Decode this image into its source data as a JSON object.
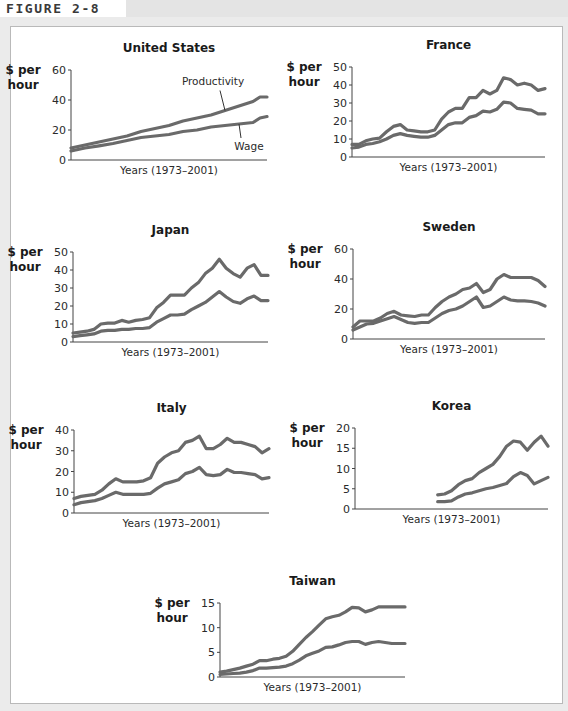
{
  "figure": {
    "label": "FIGURE 2-8"
  },
  "colors": {
    "line": "#6a6a6a",
    "axis": "#444444",
    "frame_bg": "#ffffff",
    "page_bg": "#ebebeb"
  },
  "chart_data": [
    {
      "type": "line",
      "title": "United States",
      "ylabel": [
        "$ per",
        "hour"
      ],
      "xlabel": "Years (1973–2001)",
      "ylim": [
        0,
        60
      ],
      "yticks": [
        0,
        20,
        40,
        60
      ],
      "x_range": [
        1973,
        2001
      ],
      "grid": false,
      "annotations": [
        {
          "text": "Productivity",
          "series": "Productivity"
        },
        {
          "text": "Wage",
          "series": "Wage"
        }
      ],
      "layout": {
        "ax_x": 71,
        "ax_y0": 160,
        "ax_ytop": 70,
        "ax_xend": 267
      },
      "series": [
        {
          "name": "Productivity",
          "x": [
            1973,
            1975,
            1977,
            1979,
            1981,
            1983,
            1985,
            1987,
            1989,
            1991,
            1993,
            1995,
            1997,
            1999,
            2000,
            2001
          ],
          "values": [
            8,
            10,
            12,
            14,
            16,
            19,
            21,
            23,
            26,
            28,
            30,
            33,
            36,
            39,
            42,
            42
          ]
        },
        {
          "name": "Wage",
          "x": [
            1973,
            1975,
            1977,
            1979,
            1981,
            1983,
            1985,
            1987,
            1989,
            1991,
            1993,
            1995,
            1997,
            1999,
            2000,
            2001
          ],
          "values": [
            6,
            8,
            9.5,
            11,
            13,
            15,
            16,
            17,
            19,
            20,
            22,
            23,
            24,
            25,
            28,
            29
          ]
        }
      ]
    },
    {
      "type": "line",
      "title": "France",
      "ylabel": [
        "$ per",
        "hour"
      ],
      "xlabel": "Years (1973–2001)",
      "ylim": [
        0,
        50
      ],
      "yticks": [
        0,
        10,
        20,
        30,
        40,
        50
      ],
      "x_range": [
        1973,
        2001
      ],
      "grid": false,
      "layout": {
        "ax_x": 352,
        "ax_y0": 157,
        "ax_ytop": 67,
        "ax_xend": 545
      },
      "series": [
        {
          "name": "Productivity",
          "x": [
            1973,
            1974,
            1975,
            1976,
            1977,
            1978,
            1979,
            1980,
            1981,
            1982,
            1983,
            1984,
            1985,
            1986,
            1987,
            1988,
            1989,
            1990,
            1991,
            1992,
            1993,
            1994,
            1995,
            1996,
            1997,
            1998,
            1999,
            2000,
            2001
          ],
          "values": [
            7,
            7,
            9,
            10,
            10.5,
            14,
            17,
            18,
            15,
            14.5,
            14,
            14,
            15,
            21,
            25,
            27,
            27,
            33,
            33,
            37,
            35,
            37,
            44,
            43,
            40,
            41,
            40,
            37,
            38
          ]
        },
        {
          "name": "Wage",
          "x": [
            1973,
            1974,
            1975,
            1976,
            1977,
            1978,
            1979,
            1980,
            1981,
            1982,
            1983,
            1984,
            1985,
            1986,
            1987,
            1988,
            1989,
            1990,
            1991,
            1992,
            1993,
            1994,
            1995,
            1996,
            1997,
            1998,
            1999,
            2000,
            2001
          ],
          "values": [
            5,
            5.5,
            7,
            7.5,
            8.5,
            10,
            12,
            13,
            12,
            11.5,
            11,
            11,
            12,
            15,
            18,
            19,
            19,
            22,
            23,
            25.5,
            25,
            26.5,
            30.5,
            30,
            27,
            26.5,
            26,
            24,
            24
          ]
        }
      ]
    },
    {
      "type": "line",
      "title": "Japan",
      "ylabel": [
        "$ per",
        "hour"
      ],
      "xlabel": "Years (1973–2001)",
      "ylim": [
        0,
        50
      ],
      "yticks": [
        0,
        10,
        20,
        30,
        40,
        50
      ],
      "x_range": [
        1973,
        2001
      ],
      "grid": false,
      "layout": {
        "ax_x": 73,
        "ax_y0": 342,
        "ax_ytop": 252,
        "ax_xend": 268
      },
      "series": [
        {
          "name": "Productivity",
          "x": [
            1973,
            1974,
            1975,
            1976,
            1977,
            1978,
            1979,
            1980,
            1981,
            1982,
            1983,
            1984,
            1985,
            1986,
            1987,
            1988,
            1989,
            1990,
            1991,
            1992,
            1993,
            1994,
            1995,
            1996,
            1997,
            1998,
            1999,
            2000,
            2001
          ],
          "values": [
            5,
            5.5,
            6,
            7,
            10,
            10.5,
            10.5,
            12,
            11,
            12,
            12.5,
            13.5,
            19,
            22,
            26,
            26,
            26,
            30,
            33,
            38,
            41,
            46,
            41,
            38,
            36,
            41,
            43,
            37,
            37
          ]
        },
        {
          "name": "Wage",
          "x": [
            1973,
            1974,
            1975,
            1976,
            1977,
            1978,
            1979,
            1980,
            1981,
            1982,
            1983,
            1984,
            1985,
            1986,
            1987,
            1988,
            1989,
            1990,
            1991,
            1992,
            1993,
            1994,
            1995,
            1996,
            1997,
            1998,
            1999,
            2000,
            2001
          ],
          "values": [
            3,
            3.5,
            4,
            4.5,
            6,
            6.5,
            6.5,
            7,
            7,
            7.5,
            7.5,
            8,
            11,
            13,
            15,
            15,
            15.5,
            18,
            20,
            22,
            25,
            28,
            25,
            22.5,
            21.5,
            24,
            25.5,
            23,
            23
          ]
        }
      ]
    },
    {
      "type": "line",
      "title": "Sweden",
      "ylabel": [
        "$ per",
        "hour"
      ],
      "xlabel": "Years (1973–2001)",
      "ylim": [
        0,
        60
      ],
      "yticks": [
        0,
        20,
        40,
        60
      ],
      "x_range": [
        1973,
        2001
      ],
      "grid": false,
      "layout": {
        "ax_x": 353,
        "ax_y0": 339,
        "ax_ytop": 249,
        "ax_xend": 545
      },
      "series": [
        {
          "name": "Productivity",
          "x": [
            1973,
            1974,
            1975,
            1976,
            1977,
            1978,
            1979,
            1980,
            1981,
            1982,
            1983,
            1984,
            1985,
            1986,
            1987,
            1988,
            1989,
            1990,
            1991,
            1992,
            1993,
            1994,
            1995,
            1996,
            1997,
            1998,
            1999,
            2000,
            2001
          ],
          "values": [
            8,
            12,
            12,
            12,
            14,
            17,
            18.5,
            16,
            15.5,
            15,
            16,
            16,
            21,
            25,
            28,
            30,
            33,
            34,
            37,
            31,
            33,
            40,
            43,
            41,
            41,
            41,
            41,
            39,
            35
          ]
        },
        {
          "name": "Wage",
          "x": [
            1973,
            1974,
            1975,
            1976,
            1977,
            1978,
            1979,
            1980,
            1981,
            1982,
            1983,
            1984,
            1985,
            1986,
            1987,
            1988,
            1989,
            1990,
            1991,
            1992,
            1993,
            1994,
            1995,
            1996,
            1997,
            1998,
            1999,
            2000,
            2001
          ],
          "values": [
            6,
            8,
            10,
            10.5,
            12,
            13.5,
            15,
            13,
            11,
            10.5,
            11,
            11,
            14,
            17,
            19,
            20,
            22,
            25,
            28,
            21,
            22,
            25,
            28,
            26,
            25.5,
            25.5,
            25,
            24,
            22
          ]
        }
      ]
    },
    {
      "type": "line",
      "title": "Italy",
      "ylabel": [
        "$ per",
        "hour"
      ],
      "xlabel": "Years (1973–2001)",
      "ylim": [
        0,
        40
      ],
      "yticks": [
        0,
        10,
        20,
        30,
        40
      ],
      "x_range": [
        1973,
        2001
      ],
      "grid": false,
      "layout": {
        "ax_x": 74,
        "ax_y0": 513,
        "ax_ytop": 430,
        "ax_xend": 269
      },
      "series": [
        {
          "name": "Productivity",
          "x": [
            1973,
            1974,
            1975,
            1976,
            1977,
            1978,
            1979,
            1980,
            1981,
            1982,
            1983,
            1984,
            1985,
            1986,
            1987,
            1988,
            1989,
            1990,
            1991,
            1992,
            1993,
            1994,
            1995,
            1996,
            1997,
            1998,
            1999,
            2000,
            2001
          ],
          "values": [
            7,
            8,
            8.5,
            9,
            11,
            14,
            16.5,
            15,
            15,
            15,
            15.5,
            17,
            24,
            27,
            29,
            30,
            34,
            35,
            37,
            31,
            31,
            33,
            36,
            34,
            34,
            33,
            32,
            29,
            31
          ]
        },
        {
          "name": "Wage",
          "x": [
            1973,
            1974,
            1975,
            1976,
            1977,
            1978,
            1979,
            1980,
            1981,
            1982,
            1983,
            1984,
            1985,
            1986,
            1987,
            1988,
            1989,
            1990,
            1991,
            1992,
            1993,
            1994,
            1995,
            1996,
            1997,
            1998,
            1999,
            2000,
            2001
          ],
          "values": [
            4,
            5,
            5.5,
            6,
            7,
            8.5,
            10,
            9,
            9,
            9,
            9,
            9.5,
            12,
            14,
            15,
            16,
            19,
            20,
            22,
            18.5,
            18,
            18.5,
            21,
            19.5,
            19.5,
            19,
            18.5,
            16.5,
            17
          ]
        }
      ]
    },
    {
      "type": "line",
      "title": "Korea",
      "ylabel": [
        "$ per",
        "hour"
      ],
      "xlabel": "Years (1973–2001)",
      "ylim": [
        0,
        20
      ],
      "yticks": [
        0,
        5,
        10,
        15,
        20
      ],
      "x_range": [
        1973,
        2001
      ],
      "grid": false,
      "layout": {
        "ax_x": 355,
        "ax_y0": 509,
        "ax_ytop": 428,
        "ax_xend": 548
      },
      "series": [
        {
          "name": "Productivity",
          "x": [
            1985,
            1986,
            1987,
            1988,
            1989,
            1990,
            1991,
            1992,
            1993,
            1994,
            1995,
            1996,
            1997,
            1998,
            1999,
            2000,
            2001
          ],
          "values": [
            3.5,
            3.7,
            4.5,
            6,
            7,
            7.5,
            9,
            10,
            11,
            13,
            15.5,
            16.8,
            16.5,
            14.5,
            16.5,
            18,
            15.5
          ]
        },
        {
          "name": "Wage",
          "x": [
            1985,
            1986,
            1987,
            1988,
            1989,
            1990,
            1991,
            1992,
            1993,
            1994,
            1995,
            1996,
            1997,
            1998,
            1999,
            2000,
            2001
          ],
          "values": [
            1.8,
            1.8,
            2,
            3,
            3.7,
            4,
            4.5,
            5,
            5.3,
            5.8,
            6.3,
            8,
            9,
            8.3,
            6.2,
            7,
            7.8
          ]
        }
      ]
    },
    {
      "type": "line",
      "title": "Taiwan",
      "ylabel": [
        "$ per",
        "hour"
      ],
      "xlabel": "Years (1973–2001)",
      "ylim": [
        0,
        15
      ],
      "yticks": [
        0,
        5,
        10,
        15
      ],
      "x_range": [
        1973,
        2001
      ],
      "grid": false,
      "layout": {
        "ax_x": 220,
        "ax_y0": 677,
        "ax_ytop": 603,
        "ax_xend": 405
      },
      "series": [
        {
          "name": "Productivity",
          "x": [
            1973,
            1974,
            1975,
            1976,
            1977,
            1978,
            1979,
            1980,
            1981,
            1982,
            1983,
            1984,
            1985,
            1986,
            1987,
            1988,
            1989,
            1990,
            1991,
            1992,
            1993,
            1994,
            1995,
            1996,
            1997,
            1998,
            1999,
            2000,
            2001
          ],
          "values": [
            1,
            1.2,
            1.5,
            1.8,
            2.2,
            2.6,
            3.3,
            3.3,
            3.6,
            3.8,
            4.2,
            5.2,
            6.6,
            8,
            9.2,
            10.5,
            11.8,
            12.2,
            12.5,
            13.2,
            14.1,
            14,
            13.2,
            13.6,
            14.2,
            14.2,
            14.2,
            14.2,
            14.2
          ]
        },
        {
          "name": "Wage",
          "x": [
            1973,
            1974,
            1975,
            1976,
            1977,
            1978,
            1979,
            1980,
            1981,
            1982,
            1983,
            1984,
            1985,
            1986,
            1987,
            1988,
            1989,
            1990,
            1991,
            1992,
            1993,
            1994,
            1995,
            1996,
            1997,
            1998,
            1999,
            2000,
            2001
          ],
          "values": [
            0.5,
            0.6,
            0.7,
            0.8,
            1,
            1.3,
            1.8,
            1.8,
            1.9,
            2,
            2.2,
            2.7,
            3.4,
            4.3,
            4.8,
            5.3,
            6,
            6.1,
            6.5,
            7,
            7.2,
            7.2,
            6.6,
            7,
            7.2,
            7,
            6.8,
            6.8,
            6.8
          ]
        }
      ]
    }
  ]
}
